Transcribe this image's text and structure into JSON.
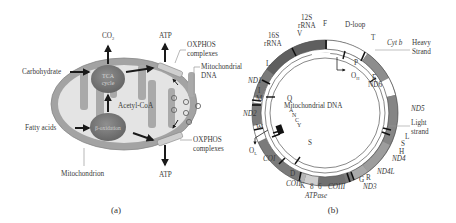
{
  "panel_a": {
    "caption": "(a)",
    "labels": {
      "co2": "CO",
      "co2_sub": "2",
      "atp_top": "ATP",
      "atp_bottom": "ATP",
      "carbohydrate": "Carbohydrate",
      "fatty_acids": "Fatty acids",
      "tca_line1": "TCA",
      "tca_line2": "cycle",
      "beta_oxidation": "β-oxidation",
      "acetyl_coa": "Acetyl-CoA",
      "oxphos_top_1": "OXPHOS",
      "oxphos_top_2": "complexes",
      "oxphos_bottom_1": "OXPHOS",
      "oxphos_bottom_2": "complexes",
      "mtdna_1": "Mitochondrial",
      "mtdna_2": "DNA",
      "mitochondrion": "Mitochondrion"
    },
    "colors": {
      "membrane": "#9a9a9a",
      "matrix": "#e2e2e2",
      "enzyme": "#7a7a7a",
      "oxphos": "#c8c8c8"
    }
  },
  "panel_b": {
    "caption": "(b)",
    "center_label": "Mitochondrial DNA",
    "strands": {
      "heavy_1": "Heavy",
      "heavy_2": "Strand",
      "light_1": "Light",
      "light_2": "strand"
    },
    "origins": {
      "oh": "O",
      "oh_sub": "H",
      "ol": "O",
      "ol_sub": "L"
    },
    "outer_genes": [
      "12S rRNA",
      "16S rRNA",
      "ND1",
      "ND2",
      "COI",
      "COII",
      "ATPase 8",
      "ATPase 6",
      "COIII",
      "ND3",
      "ND4L",
      "ND4",
      "ND5",
      "Cyt b",
      "D-loop"
    ],
    "labels": {
      "s12_1": "12S",
      "s12_2": "rRNA",
      "s16_1": "16S",
      "s16_2": "rRNA",
      "dloop": "D-loop",
      "cytb": "Cyt b",
      "nd1": "ND1",
      "nd2": "ND2",
      "nd3": "ND3",
      "nd4": "ND4",
      "nd4l": "ND4L",
      "nd5": "ND5",
      "nd6": "ND6",
      "coi": "COI",
      "coii": "COII",
      "coiii": "COIII",
      "atpase": "ATPase",
      "atp8": "8",
      "atp6": "6",
      "trna": {
        "F": "F",
        "V": "V",
        "L1": "L",
        "I": "I",
        "M": "M",
        "W": "W",
        "D": "D",
        "K": "K",
        "G": "G",
        "R": "R",
        "H": "H",
        "S1": "S",
        "L2": "L",
        "T": "T",
        "P": "P",
        "E": "E",
        "Q": "Q",
        "A": "A",
        "N": "N",
        "C": "C",
        "Y": "Y",
        "S2": "S"
      }
    },
    "colors": {
      "gene_dark": "#666666",
      "gene_mid": "#8c8c8c",
      "gene_light": "#c4c4c4",
      "noncoding": "#ffffff",
      "trna": "#111111"
    }
  }
}
